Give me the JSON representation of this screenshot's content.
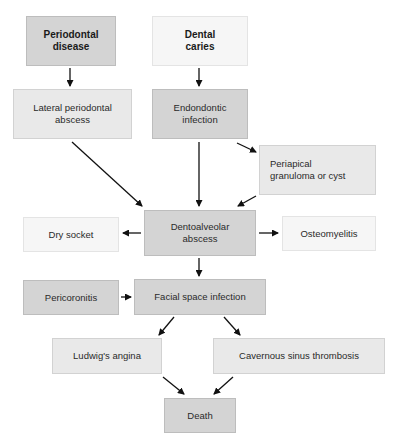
{
  "diagram": {
    "type": "flowchart",
    "nodes": {
      "periodontal_disease": "Periodontal\ndisease",
      "dental_caries": "Dental\ncaries",
      "lateral_periodontal_abscess": "Lateral periodontal\nabscess",
      "endodontic_infection": "Endondontic\ninfection",
      "periapical_granuloma": "Periapical\ngranuloma or cyst",
      "dentoalveolar_abscess": "Dentoalveolar\nabscess",
      "dry_socket": "Dry socket",
      "osteomyelitis": "Osteomyelitis",
      "pericoronitis": "Pericoronitis",
      "facial_space_infection": "Facial space infection",
      "ludwigs_angina": "Ludwig's angina",
      "cavernous_sinus_thrombosis": "Cavernous sinus thrombosis",
      "death": "Death"
    },
    "edges": [
      [
        "periodontal_disease",
        "lateral_periodontal_abscess"
      ],
      [
        "dental_caries",
        "endodontic_infection"
      ],
      [
        "lateral_periodontal_abscess",
        "dentoalveolar_abscess"
      ],
      [
        "endodontic_infection",
        "dentoalveolar_abscess"
      ],
      [
        "endodontic_infection",
        "periapical_granuloma"
      ],
      [
        "periapical_granuloma",
        "dentoalveolar_abscess"
      ],
      [
        "dentoalveolar_abscess",
        "dry_socket"
      ],
      [
        "dentoalveolar_abscess",
        "osteomyelitis"
      ],
      [
        "dentoalveolar_abscess",
        "facial_space_infection"
      ],
      [
        "pericoronitis",
        "facial_space_infection"
      ],
      [
        "facial_space_infection",
        "ludwigs_angina"
      ],
      [
        "facial_space_infection",
        "cavernous_sinus_thrombosis"
      ],
      [
        "ludwigs_angina",
        "death"
      ],
      [
        "cavernous_sinus_thrombosis",
        "death"
      ]
    ]
  }
}
